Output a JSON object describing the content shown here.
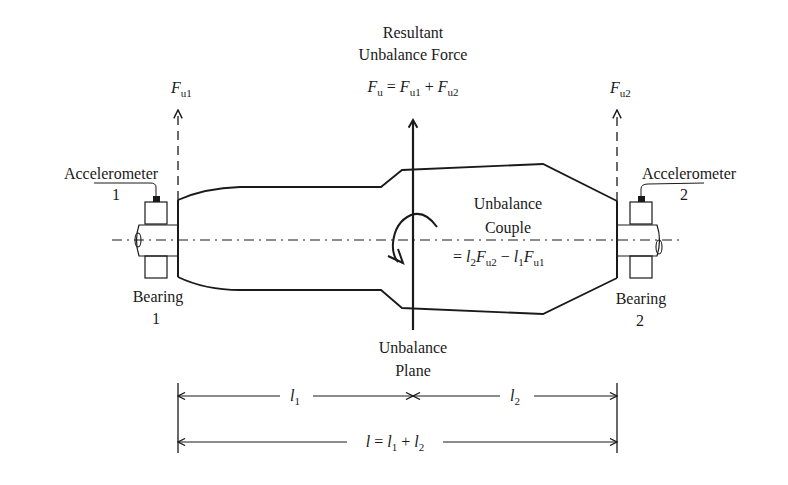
{
  "labels": {
    "resultant_line1": "Resultant",
    "resultant_line2": "Unbalance Force",
    "resultant_eq": {
      "F": "F",
      "u": "u",
      "eq": " = ",
      "Fu1_F": "F",
      "Fu1_sub": "u1",
      "plus": " + ",
      "Fu2_F": "F",
      "Fu2_sub": "u2"
    },
    "fu1": {
      "F": "F",
      "sub": "u1"
    },
    "fu2": {
      "F": "F",
      "sub": "u2"
    },
    "accelerometer1_line1": "Accelerometer",
    "accelerometer1_line2": "1",
    "accelerometer2_line1": "Accelerometer",
    "accelerometer2_line2": "2",
    "bearing1_line1": "Bearing",
    "bearing1_line2": "1",
    "bearing2_line1": "Bearing",
    "bearing2_line2": "2",
    "couple_line1": "Unbalance",
    "couple_line2": "Couple",
    "couple_eq": {
      "eq": "= ",
      "l2": "l",
      "l2_sub": "2",
      "F2": "F",
      "F2_sub": "u2",
      "minus": " − ",
      "l1": "l",
      "l1_sub": "1",
      "F1": "F",
      "F1_sub": "u1"
    },
    "plane_line1": "Unbalance",
    "plane_line2": "Plane",
    "dim_l1": {
      "l": "l",
      "sub": "1"
    },
    "dim_l2": {
      "l": "l",
      "sub": "2"
    },
    "dim_total": {
      "l": "l",
      "eq": " = ",
      "l1": "l",
      "l1_sub": "1",
      "plus": " + ",
      "l2": "l",
      "l2_sub": "2"
    }
  },
  "colors": {
    "ink": "#1a1a1a",
    "background": "#ffffff"
  }
}
